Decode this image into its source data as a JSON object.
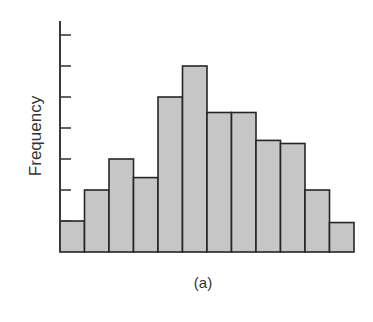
{
  "chart_data": {
    "type": "bar",
    "subtype": "histogram",
    "title": "",
    "caption": "(a)",
    "xlabel": "",
    "ylabel": "Frequency",
    "categories": [
      "1",
      "2",
      "3",
      "4",
      "5",
      "6",
      "7",
      "8",
      "9",
      "10",
      "11",
      "12"
    ],
    "values": [
      1,
      2,
      3,
      2.4,
      5,
      6,
      4.5,
      4.5,
      3.6,
      3.5,
      2,
      0.95
    ],
    "ylim": [
      0,
      7.5
    ],
    "y_ticks": [
      1,
      2,
      3,
      4,
      5,
      6,
      7
    ],
    "y_tick_labels_shown": false,
    "x_ticks_shown": false,
    "grid": false,
    "legend": null,
    "colors": {
      "bar_fill": "#c6c6c6",
      "bar_stroke": "#262626",
      "axis": "#3a3a3a"
    }
  }
}
